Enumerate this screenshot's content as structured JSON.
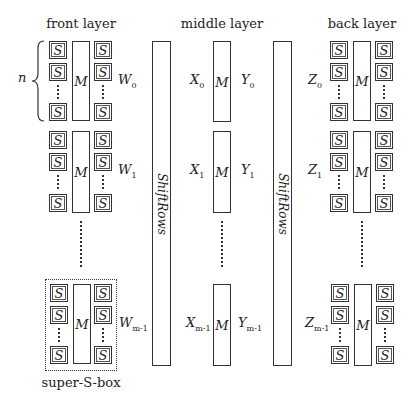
{
  "titles": {
    "front": "front layer",
    "middle": "middle layer",
    "back": "back layer"
  },
  "labels": {
    "sbox": "S",
    "mix": "M",
    "n": "n",
    "shiftrows": "ShiftRows",
    "super_sbox": "super-S-box"
  },
  "front_vars": [
    {
      "base": "W",
      "sub": "0"
    },
    {
      "base": "W",
      "sub": "1"
    },
    {
      "base": "W",
      "sub": "m-1"
    }
  ],
  "middle_in_vars": [
    {
      "base": "X",
      "sub": "0"
    },
    {
      "base": "X",
      "sub": "1"
    },
    {
      "base": "X",
      "sub": "m-1"
    }
  ],
  "middle_out_vars": [
    {
      "base": "Y",
      "sub": "0"
    },
    {
      "base": "Y",
      "sub": "1"
    },
    {
      "base": "Y",
      "sub": "m-1"
    }
  ],
  "back_vars": [
    {
      "base": "Z",
      "sub": "0"
    },
    {
      "base": "Z",
      "sub": "1"
    },
    {
      "base": "Z",
      "sub": "m-1"
    }
  ]
}
